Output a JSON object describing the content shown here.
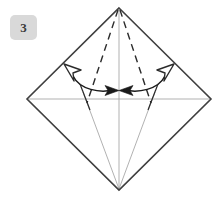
{
  "figure": {
    "kind": "origami-fold-diagram",
    "step_badge": {
      "label": "3",
      "background_color": "#d9d9d9",
      "text_color": "#3c3c3c"
    },
    "colors": {
      "outline": "#3f3f3f",
      "crease_light": "#a8a8a8",
      "fold_dashed": "#2b2b2b",
      "arrow_solid": "#1a1a1a",
      "arrow_hollow_fill": "#ffffff",
      "arrow_hollow_stroke": "#2b2b2b",
      "background": "#ffffff"
    },
    "shape": {
      "name": "diamond-square",
      "vertices": {
        "top": [
          119,
          8
        ],
        "right": [
          211,
          99
        ],
        "bottom": [
          119,
          190
        ],
        "left": [
          27,
          99
        ]
      }
    },
    "guides": [
      {
        "name": "horizontal-center-crease",
        "from": [
          27,
          99
        ],
        "to": [
          211,
          99
        ],
        "style": "light"
      },
      {
        "name": "vertical-center-crease",
        "from": [
          119,
          8
        ],
        "to": [
          119,
          190
        ],
        "style": "light"
      },
      {
        "name": "left-lower-crease",
        "from": [
          119,
          190
        ],
        "to": [
          83,
          93
        ],
        "style": "light"
      },
      {
        "name": "right-lower-crease",
        "from": [
          119,
          190
        ],
        "to": [
          155,
          93
        ],
        "style": "light"
      }
    ],
    "fold_lines": [
      {
        "name": "left-valley-fold",
        "from": [
          119,
          8
        ],
        "to": [
          86,
          104
        ],
        "style": "dashed"
      },
      {
        "name": "right-valley-fold",
        "from": [
          119,
          8
        ],
        "to": [
          152,
          104
        ],
        "style": "dashed"
      }
    ],
    "arrows": [
      {
        "name": "left-hollow-arrow",
        "direction": "up-left",
        "style": "hollow-outline"
      },
      {
        "name": "right-hollow-arrow",
        "direction": "up-right",
        "style": "hollow-outline"
      },
      {
        "name": "left-fold-arrow",
        "direction": "right-inward",
        "style": "solid-curved"
      },
      {
        "name": "right-fold-arrow",
        "direction": "left-inward",
        "style": "solid-curved"
      }
    ]
  }
}
